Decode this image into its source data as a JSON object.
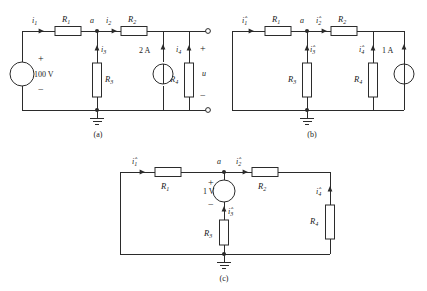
{
  "figure": {
    "background_color": "#ffffff",
    "line_color": "#2b2b2b"
  },
  "captions": {
    "a": "(a)",
    "b": "(b)",
    "c": "(c)"
  },
  "circuit_a": {
    "caption": "(a)",
    "source_voltage": {
      "value": "100 V",
      "plus": "+",
      "minus": "−",
      "symbol": "voltage-source"
    },
    "source_current": {
      "value": "2 A",
      "symbol": "current-source",
      "direction": "up"
    },
    "resistors": {
      "r1": "R",
      "r1_sub": "1",
      "r2": "R",
      "r2_sub": "2",
      "r3": "R",
      "r3_sub": "3",
      "r4": "R",
      "r4_sub": "4"
    },
    "currents": {
      "i1": "i",
      "i1_sub": "1",
      "i2": "i",
      "i2_sub": "2",
      "i3": "i",
      "i3_sub": "3",
      "i4": "i",
      "i4_sub": "4"
    },
    "node_label": "a",
    "output": {
      "plus": "+",
      "minus": "−",
      "voltage_label": "u"
    },
    "ground": "ground-symbol"
  },
  "circuit_b": {
    "caption": "(b)",
    "source_current": {
      "value": "1 A",
      "symbol": "current-source",
      "direction": "up"
    },
    "resistors": {
      "r1": "R",
      "r1_sub": "1",
      "r2": "R",
      "r2_sub": "2",
      "r3": "R",
      "r3_sub": "3",
      "r4": "R",
      "r4_sub": "4"
    },
    "currents": {
      "i1": "i",
      "i1_sub": "1",
      "i1_hat": "ˆ",
      "i2": "i",
      "i2_sub": "2",
      "i2_hat": "ˆ",
      "i3": "i",
      "i3_sub": "3",
      "i3_hat": "ˆ",
      "i4": "i",
      "i4_sub": "4",
      "i4_hat": "ˆ"
    },
    "node_label": "a",
    "ground": "ground-symbol"
  },
  "circuit_c": {
    "caption": "(c)",
    "source_voltage": {
      "value": "1 V",
      "plus": "+",
      "minus": "−",
      "symbol": "voltage-source"
    },
    "resistors": {
      "r1": "R",
      "r1_sub": "1",
      "r2": "R",
      "r2_sub": "2",
      "r3": "R",
      "r3_sub": "3",
      "r4": "R",
      "r4_sub": "4"
    },
    "currents": {
      "i1": "i",
      "i1_sub": "1",
      "i1_hat": "ˆ",
      "i2": "i",
      "i2_sub": "2",
      "i2_hat": "ˆ",
      "i3": "i",
      "i3_sub": "3",
      "i3_hat": "ˆ",
      "i4": "i",
      "i4_sub": "4",
      "i4_hat": "ˆ"
    },
    "node_label": "a",
    "ground": "ground-symbol"
  }
}
